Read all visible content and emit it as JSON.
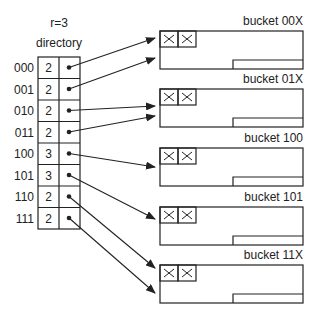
{
  "diagram": {
    "title_line1": "r=3",
    "title_line2": "directory",
    "directory": [
      {
        "index": "000",
        "depth": "2",
        "target": 0
      },
      {
        "index": "001",
        "depth": "2",
        "target": 0
      },
      {
        "index": "010",
        "depth": "2",
        "target": 1
      },
      {
        "index": "011",
        "depth": "2",
        "target": 1
      },
      {
        "index": "100",
        "depth": "3",
        "target": 2
      },
      {
        "index": "101",
        "depth": "3",
        "target": 3
      },
      {
        "index": "110",
        "depth": "2",
        "target": 4
      },
      {
        "index": "111",
        "depth": "2",
        "target": 4
      }
    ],
    "buckets": [
      {
        "label": "bucket 00X",
        "slots": [
          "X",
          "X"
        ]
      },
      {
        "label": "bucket 01X",
        "slots": [
          "X",
          "X"
        ]
      },
      {
        "label": "bucket 100",
        "slots": [
          "X",
          "X"
        ]
      },
      {
        "label": "bucket 101",
        "slots": [
          "X",
          "X"
        ]
      },
      {
        "label": "bucket 11X",
        "slots": [
          "X",
          "X"
        ]
      }
    ],
    "colors": {
      "line": "#222222",
      "background": "#ffffff"
    }
  }
}
